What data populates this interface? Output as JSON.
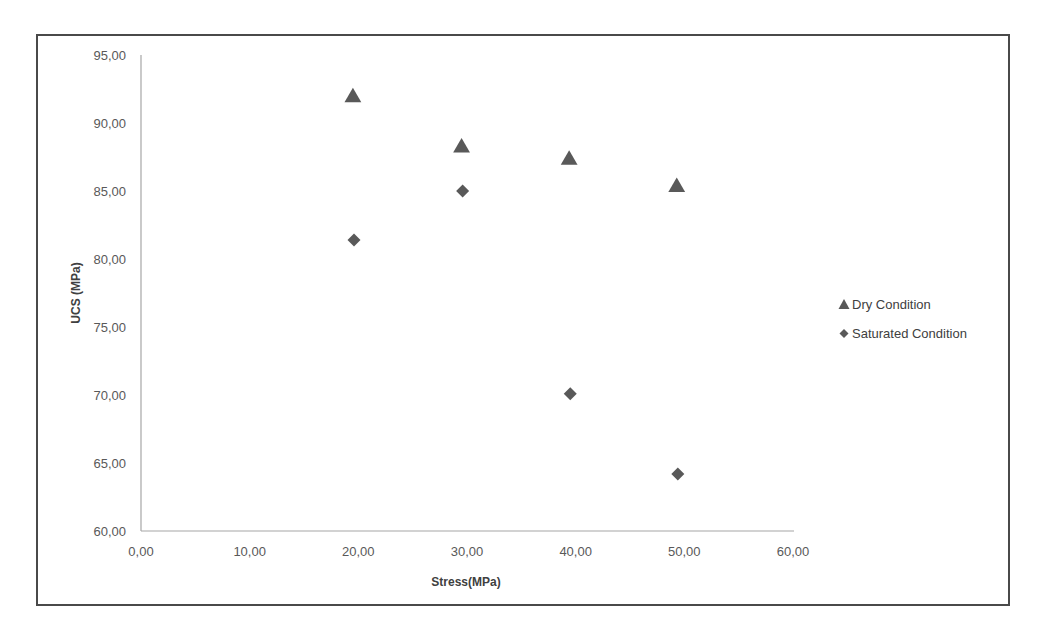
{
  "chart_data": {
    "type": "scatter",
    "title": "",
    "xlabel": "Stress(MPa)",
    "ylabel": "UCS (MPa)",
    "xlim": [
      0,
      60
    ],
    "ylim": [
      60,
      95
    ],
    "x_ticks": [
      "0,00",
      "10,00",
      "20,00",
      "30,00",
      "40,00",
      "50,00",
      "60,00"
    ],
    "y_ticks": [
      "60,00",
      "65,00",
      "70,00",
      "75,00",
      "80,00",
      "85,00",
      "90,00",
      "95,00"
    ],
    "grid": false,
    "legend_position": "right",
    "series": [
      {
        "name": "Dry Condition",
        "marker": "triangle",
        "color": "#595959",
        "points": [
          {
            "x": 19.5,
            "y": 92.0
          },
          {
            "x": 29.5,
            "y": 88.3
          },
          {
            "x": 39.4,
            "y": 87.4
          },
          {
            "x": 49.3,
            "y": 85.4
          }
        ]
      },
      {
        "name": "Saturated Condition",
        "marker": "diamond",
        "color": "#595959",
        "points": [
          {
            "x": 19.6,
            "y": 81.4
          },
          {
            "x": 29.6,
            "y": 85.0
          },
          {
            "x": 39.5,
            "y": 70.1
          },
          {
            "x": 49.4,
            "y": 64.2
          }
        ]
      }
    ]
  },
  "legend": {
    "items": [
      {
        "symbol": "▲",
        "label": "Dry Condition"
      },
      {
        "symbol": "◆",
        "label": "Saturated Condition"
      }
    ]
  },
  "colors": {
    "axis": "#a6a6a6",
    "marker": "#595959",
    "frame": "#4a4a4a",
    "text": "#595959"
  }
}
